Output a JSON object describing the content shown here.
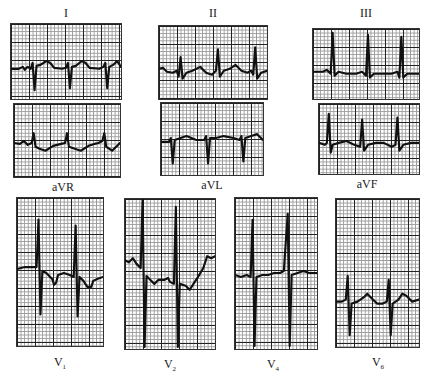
{
  "figure": {
    "type": "12-lead ECG strips",
    "leads": [
      {
        "id": "I",
        "label": "I",
        "position": "top"
      },
      {
        "id": "aVR",
        "label": "aVR",
        "position": "bottom"
      },
      {
        "id": "II",
        "label": "II",
        "position": "top"
      },
      {
        "id": "aVL",
        "label": "aVL",
        "position": "bottom"
      },
      {
        "id": "III",
        "label": "III",
        "position": "top"
      },
      {
        "id": "aVF",
        "label": "aVF",
        "position": "bottom"
      },
      {
        "id": "V1",
        "label": "V",
        "subscript": "1",
        "position": "bottom"
      },
      {
        "id": "V2",
        "label": "V",
        "subscript": "2",
        "position": "bottom"
      },
      {
        "id": "V4",
        "label": "V",
        "subscript": "4",
        "position": "bottom"
      },
      {
        "id": "V6",
        "label": "V",
        "subscript": "6",
        "position": "bottom"
      }
    ],
    "colors": {
      "trace": "#111111",
      "major_grid": "#222222",
      "minor_grid": "#9a9a9a",
      "background": "#ffffff"
    }
  }
}
